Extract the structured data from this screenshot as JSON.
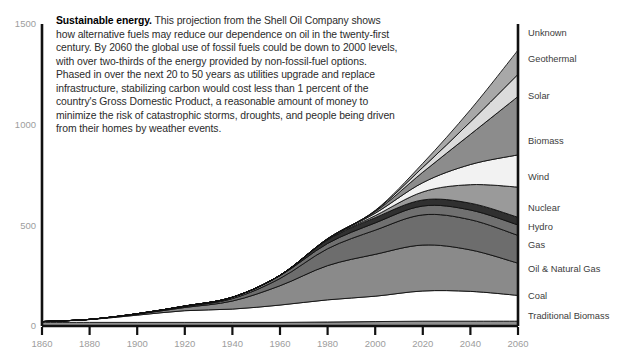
{
  "caption": {
    "lead": "Sustainable energy.",
    "body": " This projection from the Shell Oil Company shows how alternative fuels may reduce our dependence on oil in the twenty-first century. By 2060 the global use of fossil fuels could be down to 2000 levels, with over two-thirds of the energy provided by non-fossil-fuel options. Phased in over the next 20 to 50 years as utilities upgrade and replace infrastructure, stabilizing carbon would cost less than 1 percent of the country's Gross Domestic Product, a reasonable amount of money to minimize the risk of catastrophic storms, droughts, and people being driven from their homes by weather events."
  },
  "chart_data": {
    "type": "area",
    "title": "Sustainable energy",
    "xlabel": "",
    "ylabel": "",
    "xlim": [
      1860,
      2060
    ],
    "ylim": [
      0,
      1500
    ],
    "grid": false,
    "legend_position": "right",
    "stacked": true,
    "x": [
      1860,
      1880,
      1900,
      1920,
      1940,
      1960,
      1980,
      2000,
      2020,
      2040,
      2060
    ],
    "xticks": [
      "1860",
      "1880",
      "1900",
      "1920",
      "1940",
      "1960",
      "1980",
      "2000",
      "2020",
      "2040",
      "2060"
    ],
    "yticks": [
      "0",
      "500",
      "1000",
      "1500"
    ],
    "ytick_values": [
      0,
      500,
      1000,
      1500
    ],
    "series": [
      {
        "name": "Traditional Biomass",
        "color": "#8f8f8f",
        "values": [
          18,
          18,
          18,
          18,
          18,
          18,
          20,
          22,
          24,
          24,
          24
        ]
      },
      {
        "name": "Coal",
        "color": "#ffffff",
        "values": [
          4,
          14,
          36,
          58,
          66,
          86,
          110,
          126,
          150,
          148,
          128
        ]
      },
      {
        "name": "Oil & Natural Gas",
        "color": "#8a8a8a",
        "values": [
          0,
          1,
          5,
          16,
          40,
          96,
          170,
          208,
          228,
          206,
          160
        ]
      },
      {
        "name": "Gas",
        "color": "#6d6d6d",
        "values": [
          0,
          0,
          1,
          4,
          12,
          36,
          84,
          120,
          150,
          150,
          138
        ]
      },
      {
        "name": "Hydro",
        "color": "#707070",
        "values": [
          0,
          0,
          1,
          3,
          7,
          14,
          26,
          36,
          44,
          48,
          52
        ]
      },
      {
        "name": "Nuclear",
        "color": "#303030",
        "values": [
          0,
          0,
          0,
          0,
          0,
          2,
          18,
          26,
          30,
          34,
          38
        ]
      },
      {
        "name": "Wind",
        "color": "#9a9a9a",
        "values": [
          0,
          0,
          0,
          0,
          0,
          0,
          2,
          10,
          40,
          92,
          150
        ]
      },
      {
        "name": "Biomass",
        "color": "#f2f2f2",
        "values": [
          0,
          0,
          0,
          0,
          0,
          0,
          2,
          12,
          46,
          100,
          160
        ]
      },
      {
        "name": "Solar",
        "color": "#8c8c8c",
        "values": [
          0,
          0,
          0,
          0,
          0,
          0,
          1,
          8,
          52,
          150,
          290
        ]
      },
      {
        "name": "Geothermal",
        "color": "#dcdcdc",
        "values": [
          0,
          0,
          0,
          0,
          0,
          0,
          1,
          4,
          24,
          62,
          110
        ]
      },
      {
        "name": "Unknown",
        "color": "#a8a8a8",
        "values": [
          0,
          0,
          0,
          0,
          0,
          0,
          0,
          2,
          20,
          60,
          120
        ]
      }
    ],
    "legend_labels_top_to_bottom": [
      "Unknown",
      "Geothermal",
      "Solar",
      "Biomass",
      "Wind",
      "Nuclear",
      "Hydro",
      "Gas",
      "Oil & Natural Gas",
      "Coal",
      "Traditional Biomass"
    ],
    "legend_label_y": [
      36,
      62,
      99,
      144,
      180,
      211,
      230,
      248,
      272,
      299,
      319
    ]
  },
  "colors": {
    "axis": "#111111",
    "tick_text": "#9d9d9d",
    "legend_text": "#3c3c3c",
    "caption_text": "#2b2b2b",
    "background": "#ffffff"
  }
}
